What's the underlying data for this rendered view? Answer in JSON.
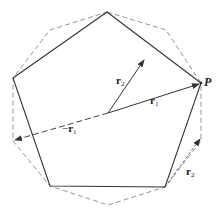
{
  "diagram": {
    "colors": {
      "solid_edge": "#333333",
      "dashed_edge": "#888888",
      "vector": "#333333",
      "background": "#ffffff"
    },
    "center": [
      108,
      113
    ],
    "pentagon": [
      [
        107,
        12
      ],
      [
        201,
        83
      ],
      [
        165,
        187
      ],
      [
        50,
        186
      ],
      [
        13,
        78
      ]
    ],
    "decagon_dashed": [
      [
        107,
        12
      ],
      [
        166,
        30
      ],
      [
        201,
        83
      ],
      [
        201,
        141
      ],
      [
        165,
        187
      ],
      [
        108,
        205
      ],
      [
        50,
        186
      ],
      [
        13,
        141
      ],
      [
        13,
        78
      ],
      [
        50,
        30
      ]
    ],
    "vectors": [
      {
        "name": "r1",
        "from": [
          108,
          113
        ],
        "to": [
          201,
          83
        ],
        "style": "solid"
      },
      {
        "name": "r2",
        "from": [
          108,
          113
        ],
        "to": [
          145,
          58
        ],
        "style": "solid"
      },
      {
        "name": "-r1",
        "from": [
          108,
          113
        ],
        "to": [
          13,
          141
        ],
        "style": "dashed"
      },
      {
        "name": "r2-translated",
        "from": [
          165,
          187
        ],
        "to": [
          201,
          138
        ],
        "style": "dashed"
      }
    ]
  },
  "labels": {
    "point_p": "P",
    "r1": {
      "base": "r",
      "sub": "1"
    },
    "r2": {
      "base": "r",
      "sub": "2"
    },
    "neg_r1": {
      "sign": "−",
      "base": "r",
      "sub": "1"
    },
    "r2_lower": {
      "base": "r",
      "sub": "2"
    }
  }
}
